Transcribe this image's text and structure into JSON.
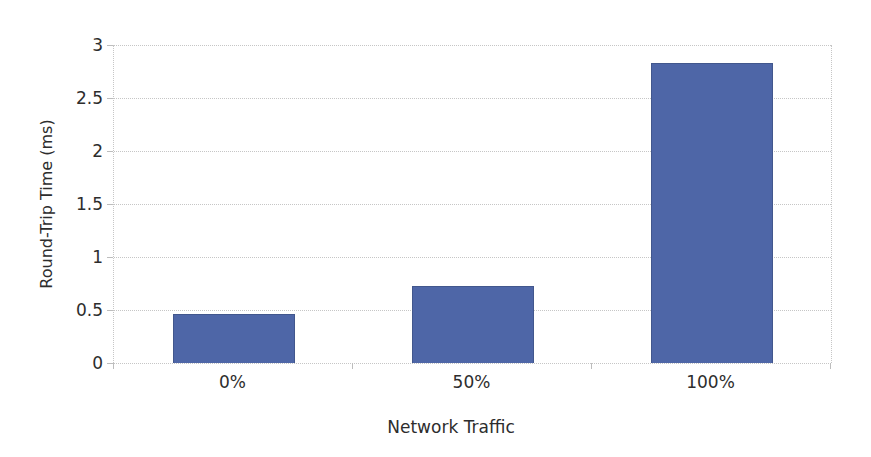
{
  "chart_data": {
    "type": "bar",
    "title": "",
    "xlabel": "Network Traffic",
    "ylabel": "Round-Trip Time (ms)",
    "categories": [
      "0%",
      "50%",
      "100%"
    ],
    "values": [
      0.46,
      0.73,
      2.83
    ],
    "ylim": [
      0,
      3
    ],
    "yticks": [
      0,
      0.5,
      1,
      1.5,
      2,
      2.5,
      3
    ],
    "ytick_labels": [
      "0",
      "0.5",
      "1",
      "1.5",
      "2",
      "2.5",
      "3"
    ],
    "grid": "horizontal dotted gridlines at every 0.5, dotted vertical lines at plot left and right edges",
    "legend": "none",
    "bar_color": "#4e66a7",
    "bar_border_color": "#42578d",
    "grid_color": "#c6c6c6",
    "tick_color": "#bdbdbd",
    "text_color": "#2d2d2d",
    "background_color": "#ffffff"
  }
}
